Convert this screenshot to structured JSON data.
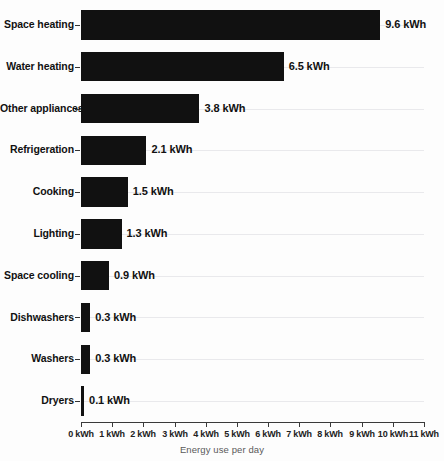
{
  "chart_data": {
    "type": "bar",
    "orientation": "horizontal",
    "title": "",
    "xlabel": "Energy use per day",
    "ylabel": "",
    "xlim": [
      0,
      11
    ],
    "grid": true,
    "legend": false,
    "unit": "kWh",
    "categories": [
      "Space heating",
      "Water heating",
      "Other appliances",
      "Refrigeration",
      "Cooking",
      "Lighting",
      "Space cooling",
      "Dishwashers",
      "Washers",
      "Dryers"
    ],
    "values": [
      9.6,
      6.5,
      3.8,
      2.1,
      1.5,
      1.3,
      0.9,
      0.3,
      0.3,
      0.1
    ],
    "data_labels": [
      "9.6 kWh",
      "6.5 kWh",
      "3.8 kWh",
      "2.1 kWh",
      "1.5 kWh",
      "1.3 kWh",
      "0.9 kWh",
      "0.3 kWh",
      "0.3 kWh",
      "0.1 kWh"
    ],
    "xticks": [
      0,
      1,
      2,
      3,
      4,
      5,
      6,
      7,
      8,
      9,
      10,
      11
    ],
    "xtick_labels": [
      "0 kWh",
      "1 kWh",
      "2 kWh",
      "3 kWh",
      "4 kWh",
      "5 kWh",
      "6 kWh",
      "7 kWh",
      "8 kWh",
      "9 kWh",
      "10 kWh",
      "11 kWh"
    ],
    "colors": {
      "bar": "#111111",
      "background": "#fdfdfd",
      "gridline": "#e9e9ec",
      "axis": "#3a3a3a",
      "label_text": "#111111",
      "axis_title_text": "#5a5a5a"
    }
  }
}
